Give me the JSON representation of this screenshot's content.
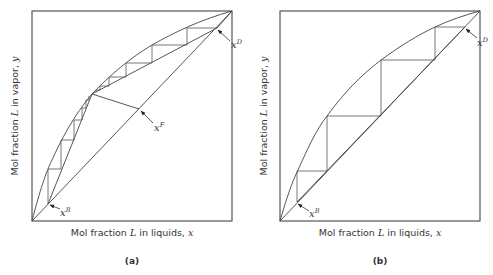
{
  "figure": {
    "panels": [
      {
        "id": "a",
        "caption": "(a)",
        "xlabel_prefix": "Mol fraction ",
        "xlabel_var": "L",
        "xlabel_mid": " in liquids, ",
        "xlabel_sym": "x",
        "ylabel_prefix": "Mol fraction ",
        "ylabel_var": "L",
        "ylabel_mid": " in vapor, ",
        "ylabel_sym": "y",
        "points": {
          "xB": {
            "base": "x",
            "sup": "B"
          },
          "xF": {
            "base": "x",
            "sup": "F"
          },
          "xD": {
            "base": "x",
            "sup": "D"
          }
        }
      },
      {
        "id": "b",
        "caption": "(b)",
        "xlabel_prefix": "Mol fraction ",
        "xlabel_var": "L",
        "xlabel_mid": " in liquids, ",
        "xlabel_sym": "x",
        "ylabel_prefix": "Mol fraction ",
        "ylabel_var": "L",
        "ylabel_mid": " in vapor, ",
        "ylabel_sym": "y",
        "points": {
          "xB": {
            "base": "x",
            "sup": "B"
          },
          "xD": {
            "base": "x",
            "sup": "D"
          }
        }
      }
    ],
    "colors": {
      "line": "#444444",
      "frame": "#555555",
      "text": "#333333",
      "background": "#ffffff"
    }
  }
}
